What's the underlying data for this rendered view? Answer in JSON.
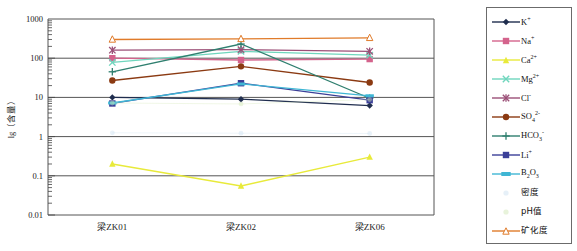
{
  "chart": {
    "type": "line",
    "ylabel": "lg（含量）",
    "xlabel": "",
    "title": "",
    "grid": true,
    "legend_position": "right"
  },
  "axes": {
    "y_ticks": [
      "1000",
      "100",
      "10",
      "1",
      "0.1",
      "0.01"
    ],
    "y_scale": "log",
    "ylim": [
      0.01,
      1000
    ],
    "x_categories": [
      "梁ZK01",
      "梁ZK02",
      "梁ZK06"
    ]
  },
  "legend": {
    "items": [
      {
        "label": "K",
        "sup": "+",
        "sub": "",
        "color": "#1f2d4e",
        "marker": "diamond",
        "faint": false
      },
      {
        "label": "Na",
        "sup": "+",
        "sub": "",
        "color": "#d4638c",
        "marker": "square",
        "faint": false
      },
      {
        "label": "Ca",
        "sup": "2+",
        "sub": "",
        "color": "#e8ea3a",
        "marker": "triangle",
        "faint": false
      },
      {
        "label": "Mg",
        "sup": "2+",
        "sub": "",
        "color": "#6fd6bd",
        "marker": "x",
        "faint": false
      },
      {
        "label": "Cl",
        "sup": "-",
        "sub": "",
        "color": "#9b4f77",
        "marker": "star",
        "faint": false
      },
      {
        "label": "SO",
        "sup": "2-",
        "sub": "4",
        "color": "#8b3a12",
        "marker": "circle",
        "faint": false
      },
      {
        "label": "HCO",
        "sup": "-",
        "sub": "3",
        "color": "#2f7f6f",
        "marker": "plus",
        "faint": false
      },
      {
        "label": "Li",
        "sup": "+",
        "sub": "",
        "color": "#3b3f98",
        "marker": "square",
        "faint": false
      },
      {
        "label": "B",
        "sup": "",
        "sub": "2O3",
        "color": "#3fb6d4",
        "marker": "dash",
        "faint": false
      },
      {
        "label": "密度",
        "sup": "",
        "sub": "",
        "color": "#cfe3f2",
        "marker": "dot",
        "faint": true
      },
      {
        "label": "pH值",
        "sup": "",
        "sub": "",
        "color": "#d3e8b8",
        "marker": "dot",
        "faint": true
      },
      {
        "label": "矿化度",
        "sup": "",
        "sub": "",
        "color": "#e07b2a",
        "marker": "triangle-open",
        "faint": false
      }
    ]
  },
  "chart_data": {
    "type": "line",
    "title": "",
    "xlabel": "",
    "ylabel": "lg（含量）",
    "yscale": "log",
    "ylim": [
      0.01,
      1000
    ],
    "grid": true,
    "legend_position": "right",
    "categories": [
      "梁ZK01",
      "梁ZK02",
      "梁ZK06"
    ],
    "series": [
      {
        "name": "K+",
        "values": [
          10,
          9,
          6.2
        ]
      },
      {
        "name": "Na+",
        "values": [
          100,
          90,
          95
        ]
      },
      {
        "name": "Ca2+",
        "values": [
          0.2,
          0.055,
          0.3
        ]
      },
      {
        "name": "Mg2+",
        "values": [
          78,
          150,
          120
        ]
      },
      {
        "name": "Cl-",
        "values": [
          160,
          165,
          150
        ]
      },
      {
        "name": "SO42-",
        "values": [
          27,
          62,
          24
        ]
      },
      {
        "name": "HCO3-",
        "values": [
          45,
          230,
          9.5
        ]
      },
      {
        "name": "Li+",
        "values": [
          7,
          23,
          8.5
        ]
      },
      {
        "name": "B2O3",
        "values": [
          7.2,
          22,
          11
        ]
      },
      {
        "name": "密度",
        "values": [
          1.25,
          1.22,
          1.2
        ]
      },
      {
        "name": "pH值",
        "values": [
          7.2,
          6.8,
          8.8
        ]
      },
      {
        "name": "矿化度",
        "values": [
          300,
          310,
          330
        ]
      }
    ]
  }
}
